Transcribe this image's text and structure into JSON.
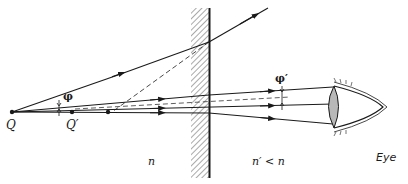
{
  "diagram": {
    "type": "optics-ray-diagram",
    "colors": {
      "ink": "#1a1a1a",
      "hatch": "#555555",
      "lens_fill": "#b8b8b8",
      "background": "#ffffff"
    },
    "labels": {
      "object_point": "Q",
      "image_point": "Q′",
      "angle_incident": "φ",
      "angle_refracted": "φ′",
      "medium_left": "n",
      "medium_right": "n′ < n",
      "eye": "Eye"
    },
    "elements": {
      "object": {
        "x": 12,
        "y": 112
      },
      "image": {
        "x": 72,
        "y": 112
      },
      "interface_x": 209,
      "hatch_from_x": 191
    }
  }
}
